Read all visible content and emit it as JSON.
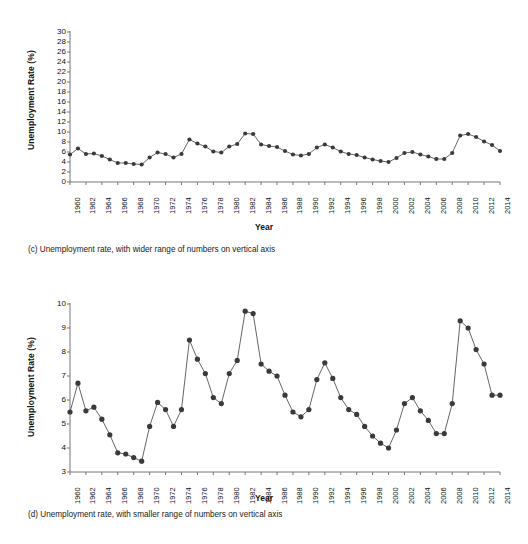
{
  "figure": {
    "panels": [
      {
        "id": "c",
        "caption": "(c) Unemployment rate, with wider range of numbers on vertical axis",
        "ylabel": "Unemployment Rate (%)",
        "xlabel": "Year",
        "yticks": [
          "0",
          "2",
          "4",
          "6",
          "8",
          "10",
          "12",
          "14",
          "16",
          "18",
          "20",
          "22",
          "24",
          "26",
          "28",
          "30"
        ],
        "ylim": [
          0,
          30
        ]
      },
      {
        "id": "d",
        "caption": "(d) Unemployment rate, with smaller range of numbers on vertical axis",
        "ylabel": "Unemployment Rate (%)",
        "xlabel": "Year",
        "yticks": [
          "3",
          "4",
          "5",
          "6",
          "7",
          "8",
          "9",
          "10"
        ],
        "ylim": [
          3,
          10
        ]
      }
    ],
    "xticks": [
      "1960",
      "1962",
      "1964",
      "1966",
      "1968",
      "1970",
      "1972",
      "1974",
      "1976",
      "1978",
      "1980",
      "1982",
      "1984",
      "1986",
      "1988",
      "1990",
      "1992",
      "1994",
      "1996",
      "1998",
      "2000",
      "2002",
      "2004",
      "2006",
      "2008",
      "2010",
      "2012",
      "2014"
    ]
  },
  "style": {
    "marker_color": "#3a3a3a",
    "line_color": "#555555",
    "axis_color": "#777777",
    "text_color": "#1a1a1a"
  },
  "chart_data": [
    {
      "type": "line",
      "panel": "c",
      "title": "(c) Unemployment rate, with wider range of numbers on vertical axis",
      "xlabel": "Year",
      "ylabel": "Unemployment Rate (%)",
      "xlim": [
        1960,
        2014
      ],
      "ylim": [
        0,
        30
      ],
      "ytick_step": 2,
      "xtick_step": 2,
      "grid": false,
      "legend": "none",
      "markers": "filled-circle",
      "x": [
        1960,
        1961,
        1962,
        1963,
        1964,
        1965,
        1966,
        1967,
        1968,
        1969,
        1970,
        1971,
        1972,
        1973,
        1974,
        1975,
        1976,
        1977,
        1978,
        1979,
        1980,
        1981,
        1982,
        1983,
        1984,
        1985,
        1986,
        1987,
        1988,
        1989,
        1990,
        1991,
        1992,
        1993,
        1994,
        1995,
        1996,
        1997,
        1998,
        1999,
        2000,
        2001,
        2002,
        2003,
        2004,
        2005,
        2006,
        2007,
        2008,
        2009,
        2010,
        2011,
        2012,
        2013,
        2014
      ],
      "values": [
        5.5,
        6.7,
        5.6,
        5.7,
        5.2,
        4.5,
        3.8,
        3.8,
        3.6,
        3.5,
        4.9,
        5.9,
        5.6,
        4.9,
        5.6,
        8.5,
        7.7,
        7.1,
        6.1,
        5.9,
        7.1,
        7.6,
        9.7,
        9.6,
        7.5,
        7.2,
        7.0,
        6.2,
        5.5,
        5.3,
        5.6,
        6.9,
        7.5,
        6.9,
        6.1,
        5.6,
        5.4,
        4.9,
        4.5,
        4.2,
        4.0,
        4.8,
        5.8,
        6.0,
        5.5,
        5.1,
        4.6,
        4.6,
        5.8,
        9.3,
        9.6,
        9.0,
        8.1,
        7.4,
        6.2
      ]
    },
    {
      "type": "line",
      "panel": "d",
      "title": "(d) Unemployment rate, with smaller range of numbers on vertical axis",
      "xlabel": "Year",
      "ylabel": "Unemployment Rate (%)",
      "xlim": [
        1960,
        2014
      ],
      "ylim": [
        3,
        10
      ],
      "ytick_step": 1,
      "xtick_step": 2,
      "grid": false,
      "legend": "none",
      "markers": "filled-circle",
      "x": [
        1960,
        1961,
        1962,
        1963,
        1964,
        1965,
        1966,
        1967,
        1968,
        1969,
        1970,
        1971,
        1972,
        1973,
        1974,
        1975,
        1976,
        1977,
        1978,
        1979,
        1980,
        1981,
        1982,
        1983,
        1984,
        1985,
        1986,
        1987,
        1988,
        1989,
        1990,
        1991,
        1992,
        1993,
        1994,
        1995,
        1996,
        1997,
        1998,
        1999,
        2000,
        2001,
        2002,
        2003,
        2004,
        2005,
        2006,
        2007,
        2008,
        2009,
        2010,
        2011,
        2012,
        2013,
        2014
      ],
      "values": [
        5.5,
        6.7,
        5.55,
        5.7,
        5.2,
        4.55,
        3.8,
        3.75,
        3.6,
        3.45,
        4.9,
        5.9,
        5.6,
        4.9,
        5.6,
        8.5,
        7.7,
        7.1,
        6.1,
        5.85,
        7.1,
        7.65,
        9.7,
        9.6,
        7.5,
        7.2,
        7.0,
        6.2,
        5.5,
        5.3,
        5.6,
        6.85,
        7.55,
        6.9,
        6.1,
        5.6,
        5.4,
        4.9,
        4.5,
        4.2,
        4.0,
        4.75,
        5.85,
        6.1,
        5.55,
        5.15,
        4.6,
        4.6,
        5.85,
        9.3,
        9.0,
        8.1,
        7.5,
        6.2,
        6.2
      ]
    }
  ]
}
